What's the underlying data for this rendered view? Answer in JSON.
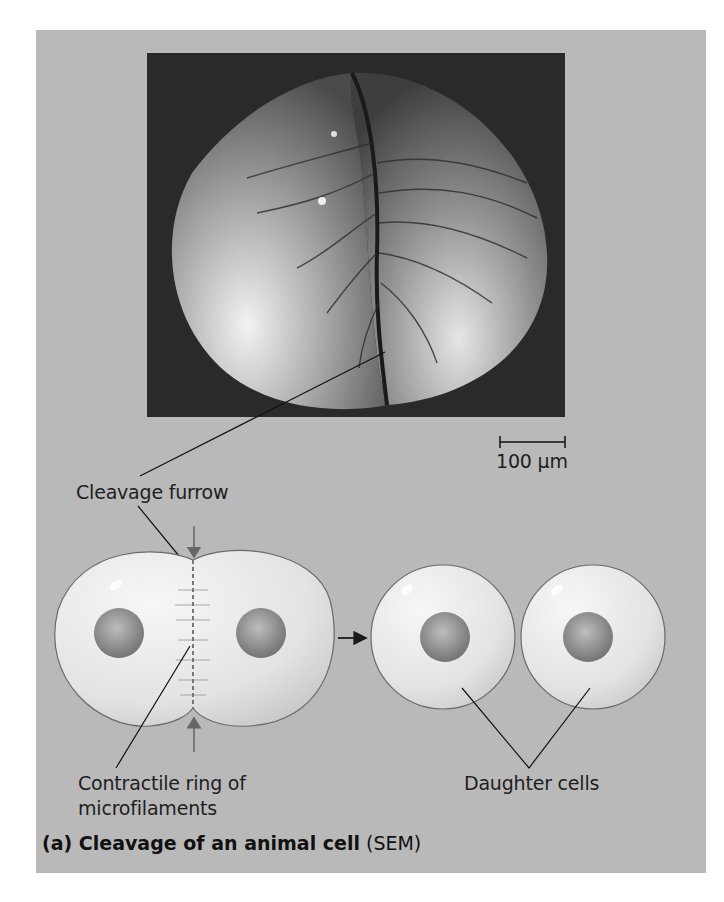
{
  "figure": {
    "panel_color": "#b9b9b9",
    "micrograph": {
      "description": "Scanning electron micrograph of a frog egg undergoing cleavage",
      "scale_bar_label": "100 µm"
    },
    "labels": {
      "cleavage_furrow": "Cleavage furrow",
      "contractile_ring_line1": "Contractile ring of",
      "contractile_ring_line2": "microfilaments",
      "daughter_cells": "Daughter cells"
    },
    "caption": {
      "bold": "(a) Cleavage of an animal cell",
      "normal": " (SEM)"
    }
  }
}
